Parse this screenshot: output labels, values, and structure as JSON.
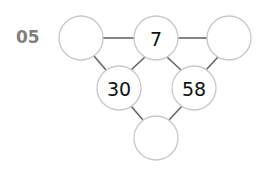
{
  "puzzle": {
    "number": "05",
    "nodes": [
      {
        "id": "top-left",
        "value": "",
        "cx": 81,
        "cy": 38
      },
      {
        "id": "top-middle",
        "value": "7",
        "cx": 156,
        "cy": 38
      },
      {
        "id": "top-right",
        "value": "",
        "cx": 229,
        "cy": 38
      },
      {
        "id": "middle-left",
        "value": "30",
        "cx": 119,
        "cy": 88
      },
      {
        "id": "middle-right",
        "value": "58",
        "cx": 194,
        "cy": 88
      },
      {
        "id": "bottom",
        "value": "",
        "cx": 156,
        "cy": 138
      }
    ],
    "colors": {
      "circle_stroke": "#c8c8c8",
      "edge": "#666666",
      "label": "#7f7f7f"
    }
  }
}
